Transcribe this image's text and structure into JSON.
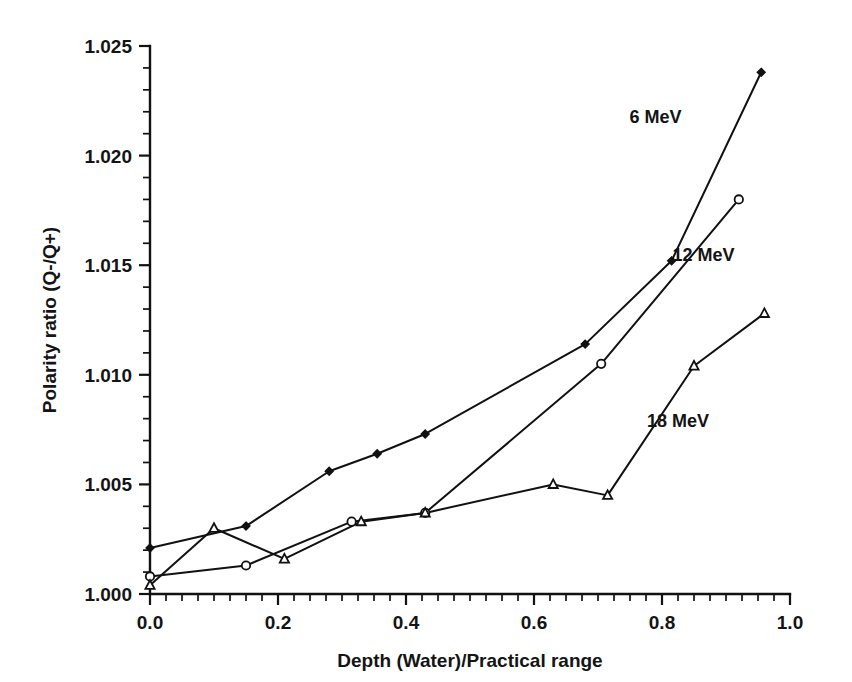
{
  "chart_data": {
    "type": "line",
    "title": "",
    "xlabel": "Depth (Water)/Practical range",
    "ylabel": "Polarity ratio (Q-/Q+)",
    "xlim": [
      0.0,
      1.0
    ],
    "ylim": [
      1.0,
      1.025
    ],
    "grid": false,
    "legend_position": "inline-annotations",
    "x_ticks": [
      "0.0",
      "0.2",
      "0.4",
      "0.6",
      "0.8",
      "1.0"
    ],
    "x_tick_values": [
      0.0,
      0.2,
      0.4,
      0.6,
      0.8,
      1.0
    ],
    "x_minor_step": 0.025,
    "y_ticks": [
      "1.000",
      "1.005",
      "1.010",
      "1.015",
      "1.020",
      "1.025"
    ],
    "y_tick_values": [
      1.0,
      1.005,
      1.01,
      1.015,
      1.02,
      1.025
    ],
    "y_minor_step": 0.001,
    "series": [
      {
        "name": "6 MeV",
        "marker": "filled-diamond",
        "label_x": 0.79,
        "label_y": 1.0215,
        "x": [
          0.0,
          0.15,
          0.28,
          0.355,
          0.43,
          0.68,
          0.815,
          0.955
        ],
        "y": [
          1.0021,
          1.0031,
          1.0056,
          1.0064,
          1.0073,
          1.0114,
          1.0152,
          1.0238
        ]
      },
      {
        "name": "12 MeV",
        "marker": "open-circle",
        "label_x": 0.865,
        "label_y": 1.0152,
        "x": [
          0.0,
          0.15,
          0.315,
          0.43,
          0.705,
          0.92
        ],
        "y": [
          1.0008,
          1.0013,
          1.0033,
          1.0037,
          1.0105,
          1.018
        ]
      },
      {
        "name": "18 MeV",
        "marker": "open-triangle",
        "label_x": 0.825,
        "label_y": 1.0076,
        "x": [
          0.0,
          0.1,
          0.21,
          0.33,
          0.43,
          0.63,
          0.715,
          0.85,
          0.96
        ],
        "y": [
          1.0004,
          1.003,
          1.0016,
          1.0033,
          1.0037,
          1.005,
          1.0045,
          1.0104,
          1.0128
        ]
      }
    ]
  }
}
